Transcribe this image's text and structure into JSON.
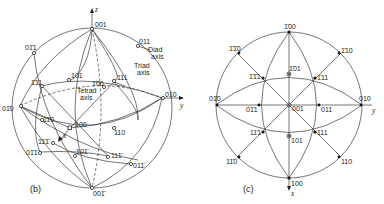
{
  "figure_b": {
    "caption": "(b)",
    "axes": {
      "x": "x",
      "y": "y",
      "z": "z"
    },
    "annotations": {
      "diad": "Diad",
      "diad2": "axis",
      "triad": "Triad",
      "triad2": "axis",
      "tetrad": "Tetrad",
      "tetrad2": "axis"
    },
    "poles": {
      "p001": "001",
      "p011": "011",
      "p0m11": "01̄1",
      "pm111": "1̄11",
      "p101": "101",
      "pm100": "1̄00",
      "p111": "111",
      "p0m10": "01̄0",
      "p010": "010",
      "p1m10": "11̄0",
      "p100": "100",
      "p110": "110",
      "p1m1m1": "11̄1̄",
      "p0m1m1": "01̄1̄",
      "p10m1": "101̄",
      "p11m1": "111̄",
      "p01m1": "011̄",
      "p00m1": "001̄"
    }
  },
  "figure_c": {
    "caption": "(c)",
    "axes": {
      "x": "x",
      "y": "y"
    },
    "poles": {
      "pm100": "1̄00",
      "pm1m10": "1̄1̄0",
      "pm110": "1̄10",
      "pm101": "1̄01",
      "pm1m11": "1̄1̄1",
      "pm111": "1̄11",
      "p0m10": "01̄0",
      "p010": "010",
      "p0m11": "01̄1",
      "p001": "001",
      "p011": "011",
      "p1m11": "11̄1",
      "p111": "111",
      "p101": "101",
      "p1m10": "11̄0",
      "p110": "110",
      "p100": "100"
    }
  }
}
